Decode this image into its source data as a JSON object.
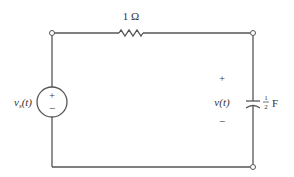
{
  "diagram": {
    "type": "circuit",
    "colors": {
      "wire": "#555555",
      "text": "#333333",
      "background": "#ffffff"
    },
    "resistor": {
      "label": "1 Ω"
    },
    "source": {
      "label_main": "v",
      "label_sub": "s",
      "label_arg": "(t)",
      "plus": "+",
      "minus": "−"
    },
    "capacitor": {
      "label_num": "1",
      "label_den": "2",
      "label_unit": "F"
    },
    "output_voltage": {
      "label": "v(t)",
      "plus": "+",
      "minus": "−"
    }
  }
}
